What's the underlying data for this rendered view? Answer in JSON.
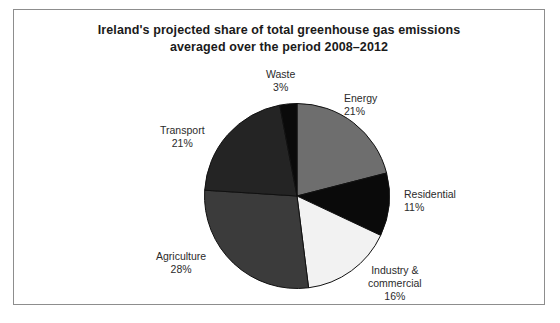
{
  "figure": {
    "title_line_1": "Ireland's projected share of total greenhouse gas emissions",
    "title_line_2": "averaged over the period 2008–2012",
    "frame_color": "#8d8d8d",
    "background_color": "#ffffff"
  },
  "chart_data": {
    "type": "pie",
    "title": "Ireland's projected share of total greenhouse gas emissions averaged over the period 2008–2012",
    "xlabel": "",
    "ylabel": "",
    "units": "percent",
    "start_angle_deg": 0,
    "direction": "clockwise",
    "legend_position": "none",
    "grid": false,
    "categories": [
      "Energy",
      "Residential",
      "Industry & commercial",
      "Agriculture",
      "Transport",
      "Waste"
    ],
    "values": [
      21,
      11,
      16,
      28,
      21,
      3
    ],
    "labels": [
      "21%",
      "11%",
      "16%",
      "28%",
      "21%",
      "3%"
    ],
    "colors": [
      "#6e6e6e",
      "#0a0a0a",
      "#f2f2f2",
      "#3b3b3b",
      "#242424",
      "#0a0a0a"
    ],
    "slices": [
      {
        "name": "Energy",
        "value": 21,
        "label": "21%",
        "color": "#6e6e6e",
        "name_line_1": "Energy"
      },
      {
        "name": "Residential",
        "value": 11,
        "label": "11%",
        "color": "#0a0a0a",
        "name_line_1": "Residential"
      },
      {
        "name": "Industry & commercial",
        "value": 16,
        "label": "16%",
        "color": "#f2f2f2",
        "name_line_1": "Industry &",
        "name_line_2": "commercial"
      },
      {
        "name": "Agriculture",
        "value": 28,
        "label": "28%",
        "color": "#3b3b3b",
        "name_line_1": "Agriculture"
      },
      {
        "name": "Transport",
        "value": 21,
        "label": "21%",
        "color": "#242424",
        "name_line_1": "Transport"
      },
      {
        "name": "Waste",
        "value": 3,
        "label": "3%",
        "color": "#0a0a0a",
        "name_line_1": "Waste"
      }
    ]
  }
}
